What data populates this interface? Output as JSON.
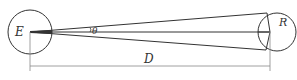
{
  "diagram": {
    "type": "geometry",
    "labels": {
      "earth": "E",
      "radius": "R",
      "angle": "θ",
      "distance": "D"
    },
    "colors": {
      "stroke": "#333333",
      "dimension_line": "#888888",
      "background": "#ffffff"
    },
    "elements": {
      "left_circle": {
        "label": "E",
        "cx": 30,
        "cy": 32,
        "r": 22
      },
      "right_circle": {
        "label": "R",
        "cx": 277,
        "cy": 32,
        "r": 19
      },
      "sight_lines": [
        "E to top of right circle",
        "E to center chord of right circle",
        "E to bottom of right circle"
      ],
      "angle_marker": "θ between center line and upper sight line",
      "dimension": "D from E center to right circle chord"
    }
  }
}
